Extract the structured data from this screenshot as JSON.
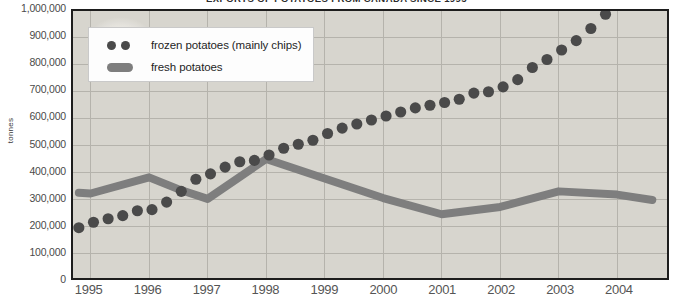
{
  "title": "EXPORTS OF POTATOES FROM CANADA SINCE 1995",
  "axis": {
    "ylabel": "tonnes",
    "yticks": [
      "1,000,000",
      "900,000",
      "800,000",
      "700,000",
      "600,000",
      "500,000",
      "400,000",
      "300,000",
      "200,000",
      "100,000",
      "0"
    ],
    "xticks": [
      "1995",
      "1996",
      "1997",
      "1998",
      "1999",
      "2000",
      "2001",
      "2002",
      "2003",
      "2004"
    ]
  },
  "legend": {
    "items": [
      {
        "label": "frozen potatoes (mainly chips)",
        "marker": "dots",
        "color": "#4a4a4a"
      },
      {
        "label": "fresh potatoes",
        "marker": "bar",
        "color": "#7e7e7e"
      }
    ]
  },
  "colors": {
    "frozen": "#4a4a4a",
    "fresh": "#7e7e7e",
    "grid": "#b4b2ab",
    "frame": "#1d1d1d",
    "plot_background": "#edece8"
  },
  "chart_data": {
    "type": "scatter",
    "title": "EXPORTS OF POTATOES FROM CANADA SINCE 1995",
    "xlabel": "",
    "ylabel": "tonnes",
    "ylim": [
      0,
      1000000
    ],
    "xlim": [
      1994.7,
      2004.85
    ],
    "grid": true,
    "legend_position": "top-left",
    "yticks": [
      0,
      100000,
      200000,
      300000,
      400000,
      500000,
      600000,
      700000,
      800000,
      900000,
      1000000
    ],
    "xticks": [
      1995,
      1996,
      1997,
      1998,
      1999,
      2000,
      2001,
      2002,
      2003,
      2004
    ],
    "series": [
      {
        "name": "frozen potatoes (mainly chips)",
        "type": "scatter",
        "color": "#4a4a4a",
        "x": [
          1994.8,
          1995.05,
          1995.3,
          1995.55,
          1995.8,
          1996.05,
          1996.3,
          1996.55,
          1996.8,
          1997.05,
          1997.3,
          1997.55,
          1997.8,
          1998.05,
          1998.3,
          1998.55,
          1998.8,
          1999.05,
          1999.3,
          1999.55,
          1999.8,
          2000.05,
          2000.3,
          2000.55,
          2000.8,
          2001.05,
          2001.3,
          2001.55,
          2001.8,
          2002.05,
          2002.3,
          2002.55,
          2002.8,
          2003.05,
          2003.3,
          2003.55,
          2003.8
        ],
        "y": [
          195000,
          215000,
          228000,
          240000,
          258000,
          262000,
          290000,
          330000,
          375000,
          395000,
          420000,
          440000,
          445000,
          465000,
          490000,
          505000,
          520000,
          545000,
          565000,
          580000,
          595000,
          610000,
          625000,
          640000,
          650000,
          660000,
          672000,
          695000,
          700000,
          718000,
          745000,
          790000,
          820000,
          855000,
          890000,
          935000,
          988000
        ]
      },
      {
        "name": "fresh potatoes",
        "type": "line",
        "color": "#7e7e7e",
        "x": [
          1994.8,
          1995.0,
          1996.0,
          1996.5,
          1997.0,
          1998.0,
          1999.0,
          2000.0,
          2001.0,
          2002.0,
          2003.0,
          2004.0,
          2004.6
        ],
        "y": [
          325000,
          322000,
          382000,
          338000,
          302000,
          450000,
          378000,
          305000,
          245000,
          272000,
          330000,
          318000,
          298000
        ]
      }
    ]
  }
}
